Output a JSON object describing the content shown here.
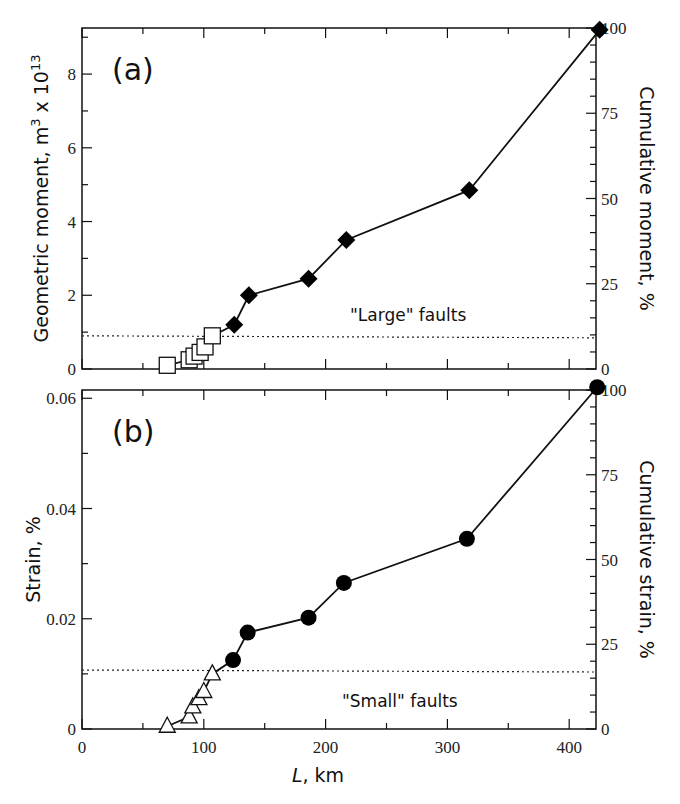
{
  "chart_data": [
    {
      "type": "line",
      "panel_label": "(a)",
      "xlabel": "L, km",
      "ylabel": "Geometric moment, m³ x 10¹³",
      "ylabel_right": "Cumulative moment, %",
      "xlim": [
        0,
        422
      ],
      "ylim": [
        0,
        9.25
      ],
      "ylim_right": [
        0,
        100
      ],
      "x_ticks": [
        0,
        100,
        200,
        300,
        400
      ],
      "y_ticks": [
        0,
        2,
        4,
        6,
        8
      ],
      "y_ticks_right": [
        0,
        25,
        50,
        75,
        100
      ],
      "grid": false,
      "threshold_line": {
        "y": 0.9,
        "style": "dotted"
      },
      "annotation": "\"Large\" faults",
      "series": [
        {
          "name": "Small faults",
          "marker": "open-square",
          "x": [
            70,
            88,
            92,
            97,
            101,
            107
          ],
          "y": [
            0.1,
            0.25,
            0.35,
            0.45,
            0.6,
            0.9
          ]
        },
        {
          "name": "Large faults",
          "marker": "filled-diamond",
          "x": [
            125,
            137,
            186,
            217,
            318,
            425
          ],
          "y": [
            1.2,
            2.0,
            2.45,
            3.5,
            4.85,
            9.2
          ]
        }
      ]
    },
    {
      "type": "line",
      "panel_label": "(b)",
      "xlabel": "L, km",
      "ylabel": "Strain, %",
      "ylabel_right": "Cumulative strain, %",
      "xlim": [
        0,
        422
      ],
      "ylim": [
        0,
        0.0615
      ],
      "ylim_right": [
        0,
        100
      ],
      "x_ticks": [
        0,
        100,
        200,
        300,
        400
      ],
      "y_ticks": [
        0,
        0.02,
        0.04,
        0.06
      ],
      "y_ticks_right": [
        0,
        25,
        50,
        75,
        100
      ],
      "grid": false,
      "threshold_line": {
        "y": 0.0107,
        "style": "dotted"
      },
      "annotation": "\"Small\" faults",
      "series": [
        {
          "name": "Small faults",
          "marker": "open-triangle",
          "x": [
            70,
            88,
            91,
            96,
            100,
            107
          ],
          "y": [
            0.0005,
            0.0022,
            0.004,
            0.0055,
            0.0068,
            0.01
          ]
        },
        {
          "name": "Large faults",
          "marker": "filled-circle",
          "x": [
            124,
            136,
            186,
            215,
            316,
            423
          ],
          "y": [
            0.0125,
            0.0175,
            0.0202,
            0.0265,
            0.0345,
            0.062
          ]
        }
      ]
    }
  ],
  "labels": {
    "panel_a": "(a)",
    "panel_b": "(b)",
    "xlabel_italic": "L",
    "xlabel_rest": ", km",
    "ylabel_a_main": "Geometric moment, m",
    "ylabel_a_sup1": "3",
    "ylabel_a_mid": " x 10",
    "ylabel_a_sup2": "13",
    "ylabel_a_right": "Cumulative moment, %",
    "ylabel_b": "Strain, %",
    "ylabel_b_right": "Cumulative strain, %",
    "annot_a": "\"Large\" faults",
    "annot_b": "\"Small\" faults",
    "x_tick_labels": [
      "0",
      "100",
      "200",
      "300",
      "400"
    ],
    "y_tick_labels_a": [
      "0",
      "2",
      "4",
      "6",
      "8"
    ],
    "y_tick_labels_b": [
      "0",
      "0.02",
      "0.04",
      "0.06"
    ],
    "y_tick_labels_right": [
      "0",
      "25",
      "50",
      "75",
      "100"
    ]
  }
}
